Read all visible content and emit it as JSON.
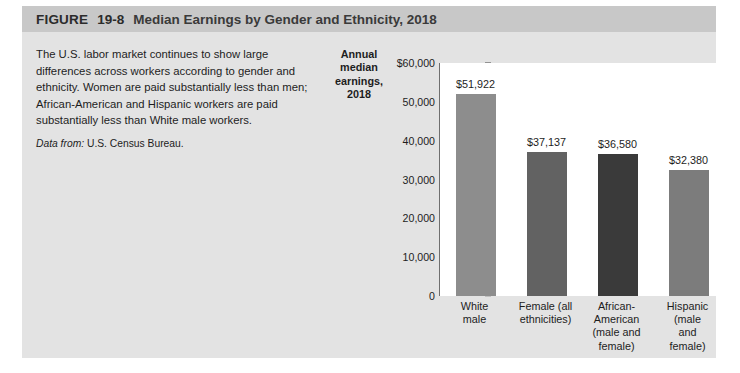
{
  "figure": {
    "label": "FIGURE",
    "number": "19-8",
    "title": "Median Earnings by Gender and Ethnicity, 2018"
  },
  "caption": {
    "body": "The U.S. labor market continues to show large differences across workers according to gender and ethnicity. Women are paid substantially less than men; African-American and Hispanic workers are paid substantially less than White male workers.",
    "source_label": "Data from:",
    "source_text": " U.S. Census Bureau."
  },
  "chart_data": {
    "type": "bar",
    "title": "Median Earnings by Gender and Ethnicity, 2018",
    "ylabel": "Annual median earnings, 2018",
    "xlabel": "",
    "ylim": [
      0,
      60000
    ],
    "grid": false,
    "legend": "none",
    "tick_labels": [
      "$60,000",
      "50,000",
      "40,000",
      "30,000",
      "20,000",
      "10,000",
      "0"
    ],
    "ticks": [
      60000,
      50000,
      40000,
      30000,
      20000,
      10000,
      0
    ],
    "categories": [
      "White male",
      "Female (all ethnicities)",
      "African-American (male and female)",
      "Hispanic (male and female)"
    ],
    "category_lines": [
      [
        "White",
        "male"
      ],
      [
        "Female (all",
        "ethnicities)"
      ],
      [
        "African-",
        "American",
        "(male and",
        "female)"
      ],
      [
        "Hispanic",
        "(male and",
        "female)"
      ]
    ],
    "values": [
      51922,
      37137,
      36580,
      32380
    ],
    "value_labels": [
      "$51,922",
      "$37,137",
      "$36,580",
      "$32,380"
    ],
    "bar_colors": [
      "#8d8d8d",
      "#626262",
      "#3a3a3a",
      "#7c7c7c"
    ]
  },
  "colors": {
    "panel_background": "#e3e3e3",
    "header_background": "#c8c8c8",
    "plot_background": "#ffffff",
    "axis_line": "#6f6f6f",
    "text": "#1d1d1d"
  }
}
